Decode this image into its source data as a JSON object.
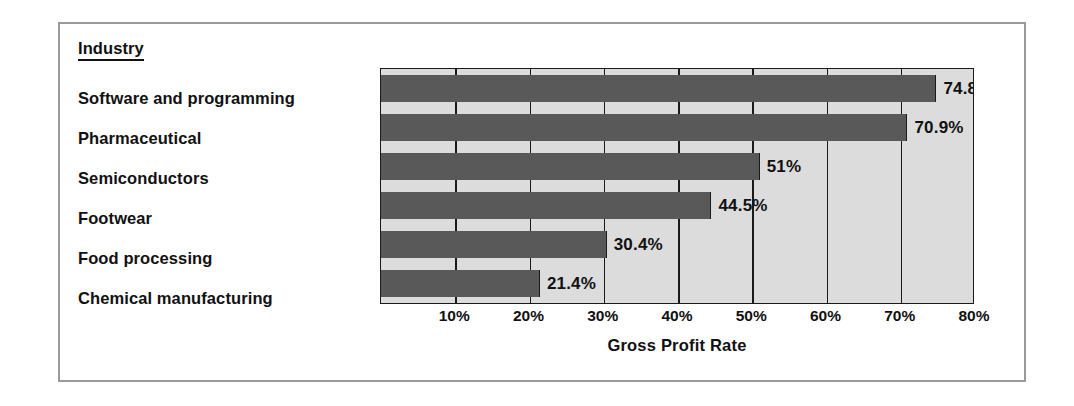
{
  "figure": {
    "category_header": "Industry",
    "frame_color": "#9a9a9a"
  },
  "chart_data": {
    "type": "bar",
    "orientation": "horizontal",
    "title": "",
    "xlabel": "Gross Profit Rate",
    "ylabel": "Industry",
    "categories": [
      "Software and programming",
      "Pharmaceutical",
      "Semiconductors",
      "Footwear",
      "Food processing",
      "Chemical manufacturing"
    ],
    "values": [
      74.8,
      70.9,
      51,
      44.5,
      30.4,
      21.4
    ],
    "value_labels": [
      "74.8%",
      "70.9%",
      "51%",
      "44.5%",
      "30.4%",
      "21.4%"
    ],
    "xlim": [
      0,
      80
    ],
    "xticks": [
      10,
      20,
      30,
      40,
      50,
      60,
      70,
      80
    ],
    "xtick_labels": [
      "10%",
      "20%",
      "30%",
      "40%",
      "50%",
      "60%",
      "70%",
      "80%"
    ],
    "grid": true,
    "grid_axis": "x",
    "legend": false,
    "bar_color": "#595959",
    "plot_background": "#dcdcdc",
    "axis_color": "#1a1a1a"
  }
}
